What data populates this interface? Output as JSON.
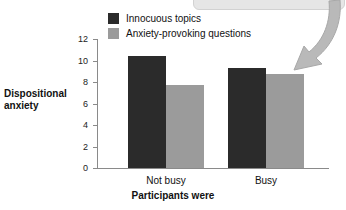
{
  "chart_data": {
    "type": "bar",
    "title": "",
    "xlabel": "Participants were",
    "ylabel": "Dispositional anxiety",
    "ylabel_line1": "Dispositional",
    "ylabel_line2": "anxiety",
    "categories": [
      "Not busy",
      "Busy"
    ],
    "series": [
      {
        "name": "Innocuous topics",
        "color": "#2b2b2b",
        "values": [
          10.4,
          9.3
        ]
      },
      {
        "name": "Anxiety-provoking questions",
        "color": "#9b9b9b",
        "values": [
          7.7,
          8.7
        ]
      }
    ],
    "ylim": [
      0,
      12
    ],
    "yticks": [
      0,
      2,
      4,
      6,
      8,
      10,
      12
    ],
    "ytick_labels": [
      "0",
      "2",
      "4",
      "6",
      "8",
      "10",
      "12"
    ],
    "grid": false,
    "legend_position": "top-left-inside"
  },
  "legend": {
    "items": [
      {
        "label": "Innocuous topics",
        "swatch": "dark"
      },
      {
        "label": "Anxiety-provoking questions",
        "swatch": "light"
      }
    ]
  },
  "callout": {
    "label": "",
    "arrow_icon": "curved-arrow-icon",
    "color": "#b4b4b4"
  }
}
